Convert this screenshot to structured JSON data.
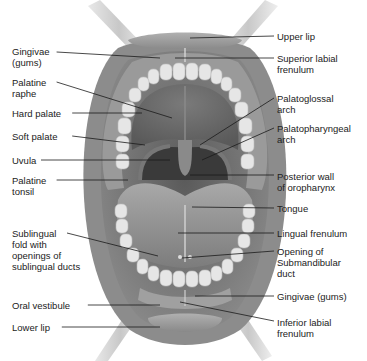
{
  "diagram": {
    "colors": {
      "background": "#ffffff",
      "text": "#222222",
      "leader_line": "#1a1a1a",
      "lips": "#9a9a9a",
      "mucosa": "#7e7e7e",
      "teeth": "#e6e6e6",
      "palate": "#6e6e6e",
      "pharynx": "#3a3a3a",
      "tongue": "#8c8c8c",
      "retractor": "#cfcfcf"
    },
    "labels_left": [
      {
        "id": "gingivae-upper",
        "text": "Gingivae\n(gums)",
        "x": 12,
        "y": 46,
        "line_y": 52,
        "target": [
          160,
          58
        ]
      },
      {
        "id": "palatine-raphe",
        "text": "Palatine\nraphe",
        "x": 12,
        "y": 77,
        "line_y": 82,
        "target": [
          172,
          118
        ]
      },
      {
        "id": "hard-palate",
        "text": "Hard palate",
        "x": 12,
        "y": 108,
        "line_y": 113,
        "target": [
          142,
          113
        ]
      },
      {
        "id": "soft-palate",
        "text": "Soft palate",
        "x": 12,
        "y": 131,
        "line_y": 136,
        "target": [
          145,
          145
        ]
      },
      {
        "id": "uvula",
        "text": "Uvula",
        "x": 12,
        "y": 155,
        "line_y": 160,
        "target": [
          170,
          160
        ]
      },
      {
        "id": "palatine-tonsil",
        "text": "Palatine\ntonsil",
        "x": 12,
        "y": 175,
        "line_y": 180,
        "target": [
          128,
          180
        ]
      },
      {
        "id": "sublingual-fold",
        "text": "Sublingual\nfold with\nopenings of\nsublingual ducts",
        "x": 12,
        "y": 228,
        "line_y": 233,
        "target": [
          158,
          256
        ]
      },
      {
        "id": "oral-vestibule",
        "text": "Oral vestibule",
        "x": 12,
        "y": 300,
        "line_y": 305,
        "target": [
          160,
          305
        ]
      },
      {
        "id": "lower-lip",
        "text": "Lower lip",
        "x": 12,
        "y": 322,
        "line_y": 327,
        "target": [
          160,
          327
        ]
      }
    ],
    "labels_right": [
      {
        "id": "upper-lip",
        "text": "Upper lip",
        "x": 277,
        "y": 31,
        "line_y": 36,
        "target": [
          190,
          38
        ]
      },
      {
        "id": "superior-labial-frenulum",
        "text": "Superior labial\nfrenulum",
        "x": 277,
        "y": 53,
        "line_y": 58,
        "target": [
          175,
          58
        ]
      },
      {
        "id": "palatoglossal-arch",
        "text": "Palatoglossal\narch",
        "x": 277,
        "y": 93,
        "line_y": 98,
        "target": [
          200,
          145
        ]
      },
      {
        "id": "palatopharyngeal-arch",
        "text": "Palatopharyngeal\narch",
        "x": 277,
        "y": 123,
        "line_y": 128,
        "target": [
          202,
          160
        ]
      },
      {
        "id": "posterior-wall-oropharynx",
        "text": "Posterior wall\nof oropharynx",
        "x": 277,
        "y": 171,
        "line_y": 175,
        "target": [
          190,
          175
        ]
      },
      {
        "id": "tongue",
        "text": "Tongue",
        "x": 277,
        "y": 203,
        "line_y": 208,
        "target": [
          192,
          207
        ]
      },
      {
        "id": "lingual-frenulum",
        "text": "Lingual frenulum",
        "x": 277,
        "y": 228,
        "line_y": 233,
        "target": [
          178,
          233
        ]
      },
      {
        "id": "opening-submandibular-duct",
        "text": "Opening of\nSubmandibular\nduct",
        "x": 277,
        "y": 246,
        "line_y": 251,
        "target": [
          182,
          258
        ]
      },
      {
        "id": "gingivae-lower",
        "text": "Gingivae (gums)",
        "x": 277,
        "y": 291,
        "line_y": 296,
        "target": [
          195,
          296
        ]
      },
      {
        "id": "inferior-labial-frenulum",
        "text": "Inferior labial\nfrenulum",
        "x": 277,
        "y": 317,
        "line_y": 321,
        "target": [
          180,
          302
        ]
      }
    ]
  }
}
